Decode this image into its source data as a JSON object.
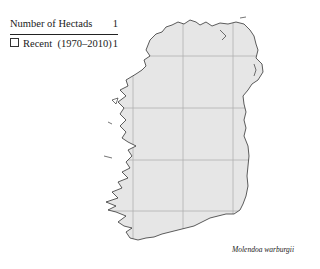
{
  "legend": {
    "header": {
      "label": "Number of Hectads",
      "value": "1"
    },
    "rows": [
      {
        "symbol": "open-square",
        "label": "Recent  (1970–2010)",
        "value": "1"
      }
    ]
  },
  "map": {
    "region": "Ireland",
    "land_fill": "#e6e6e6",
    "coast_color": "#1a1a1a",
    "grid_color": "#b0b0b0",
    "grid": {
      "vertical_x": [
        133,
        183,
        233
      ],
      "horizontal_y": [
        56,
        108,
        160,
        211
      ]
    },
    "records": []
  },
  "caption": {
    "species": "Molendoa warburgii"
  }
}
